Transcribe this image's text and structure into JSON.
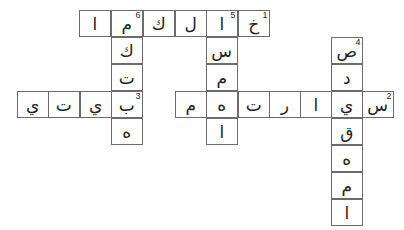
{
  "puzzle": {
    "type": "arabic-crossword",
    "cell_size": {
      "w": 31.5,
      "h": 27
    },
    "cells": [
      {
        "x": 79,
        "y": 10,
        "letter": "ا",
        "num": ""
      },
      {
        "x": 111,
        "y": 10,
        "letter": "م",
        "num": "6"
      },
      {
        "x": 143,
        "y": 10,
        "letter": "ك",
        "num": ""
      },
      {
        "x": 175,
        "y": 10,
        "letter": "ل",
        "num": ""
      },
      {
        "x": 206,
        "y": 10,
        "letter": "ا",
        "num": "5"
      },
      {
        "x": 238,
        "y": 10,
        "letter": "خ",
        "num": "1"
      },
      {
        "x": 111,
        "y": 37,
        "letter": "ك",
        "num": ""
      },
      {
        "x": 111,
        "y": 64,
        "letter": "ت",
        "num": ""
      },
      {
        "x": 111,
        "y": 91,
        "letter": "ب",
        "num": "3"
      },
      {
        "x": 111,
        "y": 118,
        "letter": "ه",
        "num": ""
      },
      {
        "x": 17,
        "y": 91,
        "letter": "ي",
        "num": ""
      },
      {
        "x": 48,
        "y": 91,
        "letter": "ت",
        "num": ""
      },
      {
        "x": 80,
        "y": 91,
        "letter": "ي",
        "num": ""
      },
      {
        "x": 206,
        "y": 37,
        "letter": "س",
        "num": ""
      },
      {
        "x": 206,
        "y": 64,
        "letter": "م",
        "num": ""
      },
      {
        "x": 206,
        "y": 118,
        "letter": "ا",
        "num": ""
      },
      {
        "x": 175,
        "y": 91,
        "letter": "م",
        "num": ""
      },
      {
        "x": 206,
        "y": 91,
        "letter": "ه",
        "num": ""
      },
      {
        "x": 238,
        "y": 91,
        "letter": "ت",
        "num": ""
      },
      {
        "x": 269,
        "y": 91,
        "letter": "ر",
        "num": ""
      },
      {
        "x": 300,
        "y": 91,
        "letter": "ا",
        "num": ""
      },
      {
        "x": 331,
        "y": 91,
        "letter": "ي",
        "num": ""
      },
      {
        "x": 362,
        "y": 91,
        "letter": "س",
        "num": "2"
      },
      {
        "x": 331,
        "y": 37,
        "letter": "ص",
        "num": "4"
      },
      {
        "x": 331,
        "y": 64,
        "letter": "د",
        "num": ""
      },
      {
        "x": 331,
        "y": 118,
        "letter": "ق",
        "num": ""
      },
      {
        "x": 331,
        "y": 145,
        "letter": "ه",
        "num": ""
      },
      {
        "x": 331,
        "y": 172,
        "letter": "م",
        "num": ""
      },
      {
        "x": 331,
        "y": 199,
        "letter": "ا",
        "num": ""
      }
    ],
    "words": [
      {
        "num": "1",
        "direction": "across",
        "answer": "خالكما"
      },
      {
        "num": "2",
        "direction": "across",
        "answer": "سيارتهم"
      },
      {
        "num": "3",
        "direction": "across",
        "answer": "بيتي"
      },
      {
        "num": "4",
        "direction": "down",
        "answer": "صديقهما"
      },
      {
        "num": "5",
        "direction": "down",
        "answer": "اسمها"
      },
      {
        "num": "6",
        "direction": "down",
        "answer": "مكتبه"
      }
    ]
  }
}
